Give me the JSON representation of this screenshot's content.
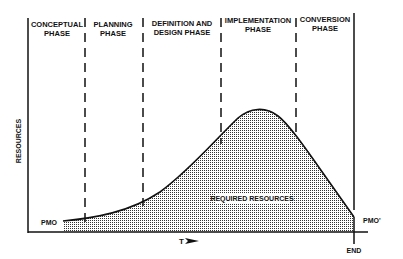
{
  "phases": [
    {
      "line1": "CONCEPTUAL",
      "line2": "PHASE"
    },
    {
      "line1": "PLANNING",
      "line2": "PHASE"
    },
    {
      "line1": "DEFINITION AND",
      "line2": "DESIGN PHASE"
    },
    {
      "line1": "IMPLEMENTATION",
      "line2": "PHASE"
    },
    {
      "line1": "CONVERSION",
      "line2": "PHASE"
    }
  ],
  "axes": {
    "y_label": "RESOURCES",
    "x_label": "T",
    "x_arrow_icon": "arrow-right-icon"
  },
  "markers": {
    "start": "PMO",
    "end_value": "PMO'",
    "end_time": "END"
  },
  "area_label": "REQUIRED RESOURCES",
  "colors": {
    "ink": "#111111",
    "fill_dots": "#555555",
    "background": "#ffffff"
  }
}
